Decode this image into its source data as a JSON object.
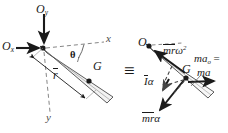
{
  "figure": {
    "type": "free-body-and-kinetic-diagram",
    "equivalence_symbol": "≡"
  },
  "free_body": {
    "pivot_label": "O",
    "reaction_vertical": {
      "base": "O",
      "subscript": "y"
    },
    "reaction_horizontal": {
      "base": "O",
      "subscript": "x"
    },
    "axis_x": "x",
    "axis_y": "y",
    "angle_label": "θ",
    "centroid_label": "G",
    "radius_label": "r"
  },
  "kinetic": {
    "pivot_label": "O",
    "centroid_label": "G",
    "normal_term": {
      "base": "mr",
      "exponent_base": "ω",
      "exponent": "2"
    },
    "effective_force": {
      "base": "ma",
      "subscript": "o"
    },
    "equals_sign": "=",
    "resultant": "ma",
    "couple_term": {
      "base": "I",
      "symbol": "α"
    },
    "tangential_term": {
      "base": "mr",
      "symbol": "α"
    }
  },
  "colors": {
    "ink": "#1a1a1a",
    "rod_fill": "#f2f2f2",
    "rod_stroke": "#333333",
    "dashed": "#555555",
    "background": "#ffffff"
  }
}
